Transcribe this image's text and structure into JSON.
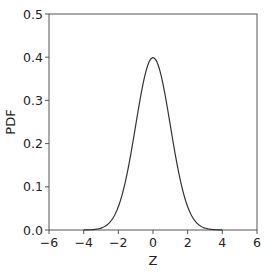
{
  "chart_data": {
    "type": "line",
    "title": "",
    "xlabel": "Z",
    "ylabel": "PDF",
    "xlim": [
      -6,
      6
    ],
    "ylim": [
      0.0,
      0.5
    ],
    "grid": false,
    "legend": null,
    "x_ticks": [
      "−6",
      "−4",
      "−2",
      "0",
      "2",
      "4",
      "6"
    ],
    "y_ticks": [
      "0.0",
      "0.1",
      "0.2",
      "0.3",
      "0.4",
      "0.5"
    ],
    "series": [
      {
        "name": "Standard normal PDF",
        "color": "#333333",
        "x": [
          -4,
          -3.5,
          -3,
          -2.5,
          -2,
          -1.5,
          -1,
          -0.5,
          0,
          0.5,
          1,
          1.5,
          2,
          2.5,
          3,
          3.5,
          4
        ],
        "y": [
          0.0001,
          0.0009,
          0.0044,
          0.0175,
          0.054,
          0.1295,
          0.242,
          0.3521,
          0.3989,
          0.3521,
          0.242,
          0.1295,
          0.054,
          0.0175,
          0.0044,
          0.0009,
          0.0001
        ]
      }
    ]
  }
}
